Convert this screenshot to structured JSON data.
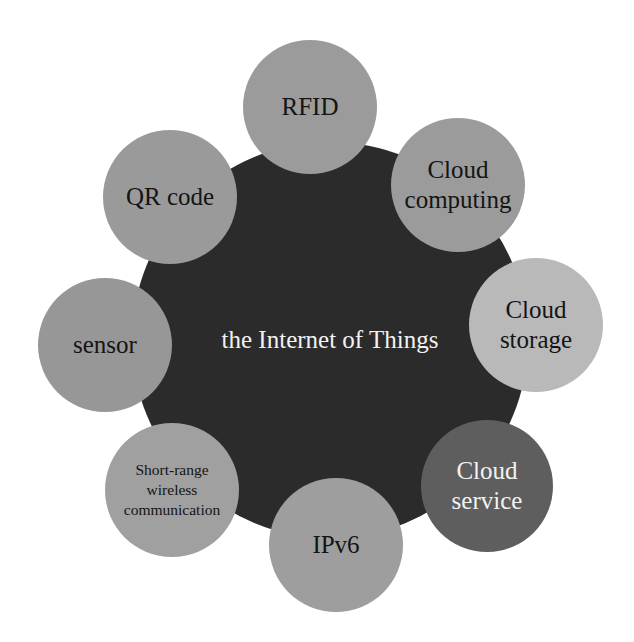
{
  "diagram": {
    "title": "the Internet of Things",
    "hub": {
      "label": "the Internet of Things",
      "cx": 330,
      "cy": 340,
      "r": 198,
      "color": "#2b2b2b",
      "text_color": "#f2f2f2"
    },
    "nodes": [
      {
        "label": "RFID",
        "cx": 310,
        "cy": 107,
        "r": 67,
        "color": "#9b9b9b",
        "text_color": "#141414",
        "size": "normal"
      },
      {
        "label": "Cloud\ncomputing",
        "cx": 458,
        "cy": 185,
        "r": 67,
        "color": "#9b9b9b",
        "text_color": "#141414",
        "size": "normal"
      },
      {
        "label": "Cloud\nstorage",
        "cx": 536,
        "cy": 325,
        "r": 67,
        "color": "#b9b9b9",
        "text_color": "#141414",
        "size": "normal"
      },
      {
        "label": "Cloud\nservice",
        "cx": 487,
        "cy": 486,
        "r": 66,
        "color": "#5e5e5e",
        "text_color": "#f2f2f2",
        "size": "normal"
      },
      {
        "label": "IPv6",
        "cx": 336,
        "cy": 545,
        "r": 67,
        "color": "#9e9e9e",
        "text_color": "#141414",
        "size": "normal"
      },
      {
        "label": "Short-range\nwireless\ncommunication",
        "cx": 172,
        "cy": 490,
        "r": 67,
        "color": "#a0a0a0",
        "text_color": "#141414",
        "size": "small"
      },
      {
        "label": "sensor",
        "cx": 105,
        "cy": 345,
        "r": 67,
        "color": "#979797",
        "text_color": "#141414",
        "size": "normal"
      },
      {
        "label": "QR code",
        "cx": 170,
        "cy": 197,
        "r": 67,
        "color": "#9a9a9a",
        "text_color": "#141414",
        "size": "normal"
      }
    ]
  }
}
